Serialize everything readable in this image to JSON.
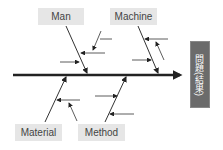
{
  "diagram": {
    "type": "fishbone",
    "effect": "問題(結果)",
    "categories": [
      {
        "label": "Man",
        "position": "top"
      },
      {
        "label": "Machine",
        "position": "top"
      },
      {
        "label": "Material",
        "position": "bottom"
      },
      {
        "label": "Method",
        "position": "bottom"
      }
    ],
    "colors": {
      "spine": "#222222",
      "box": "#e6e6e6",
      "effect_box": "#6b6b6b"
    }
  }
}
